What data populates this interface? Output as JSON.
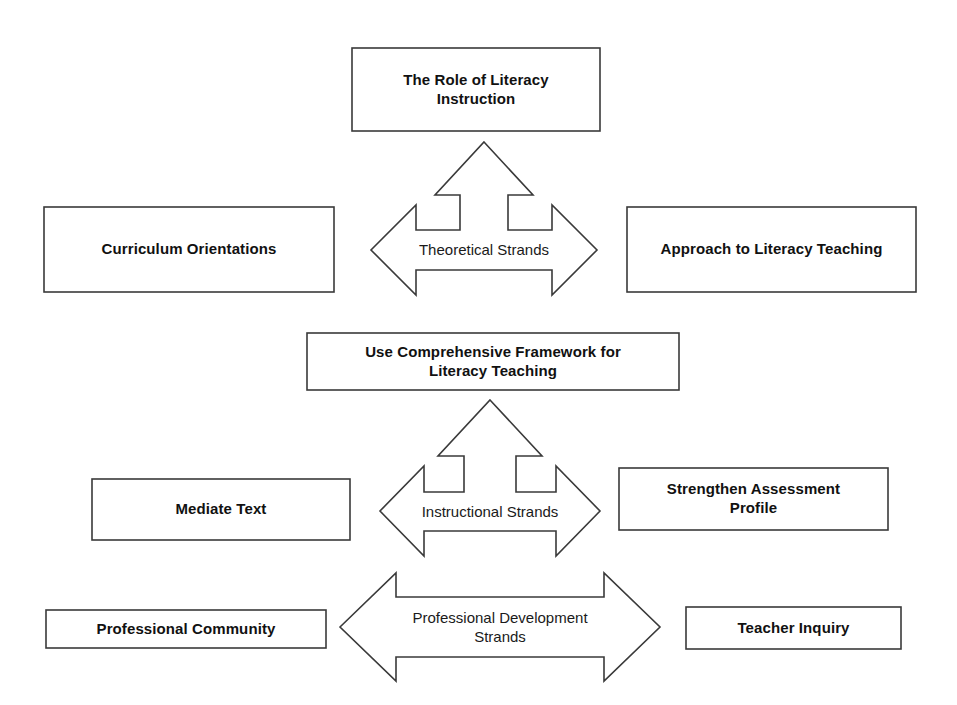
{
  "diagram": {
    "title": "Comprehensive Framework for Literacy Teaching",
    "type": "hierarchical-strand-diagram",
    "background_color": "#ffffff",
    "line_color": "#3a3a3a",
    "text_color": "#111111"
  },
  "boxes": {
    "role_of_literacy": {
      "label": "The Role of Literacy Instruction",
      "line1": "The Role of Literacy",
      "line2": "Instruction"
    },
    "curriculum_orientations": {
      "label": "Curriculum Orientations"
    },
    "approach_to_literacy_teaching": {
      "label": "Approach to Literacy Teaching"
    },
    "use_comprehensive_framework": {
      "label": "Use Comprehensive Framework for Literacy Teaching",
      "line1": "Use Comprehensive Framework for",
      "line2": "Literacy Teaching"
    },
    "mediate_text": {
      "label": "Mediate Text"
    },
    "strengthen_assessment_profile": {
      "label": "Strengthen Assessment Profile",
      "line1": "Strengthen Assessment",
      "line2": "Profile"
    },
    "professional_community": {
      "label": "Professional Community"
    },
    "teacher_inquiry": {
      "label": "Teacher Inquiry"
    }
  },
  "arrows": {
    "theoretical_strands": {
      "label": "Theoretical Strands",
      "directions": "up-left-right"
    },
    "instructional_strands": {
      "label": "Instructional Strands",
      "directions": "up-left-right"
    },
    "professional_development_strands": {
      "label": "Professional Development Strands",
      "line1": "Professional Development",
      "line2": "Strands",
      "directions": "left-right"
    }
  }
}
